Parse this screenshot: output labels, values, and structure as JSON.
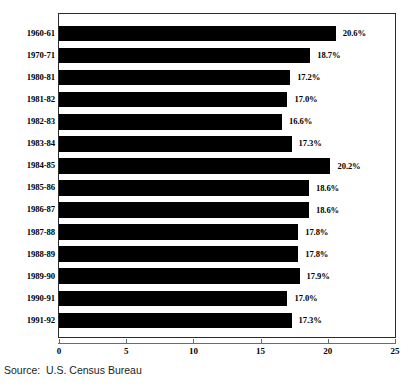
{
  "chart_data": {
    "type": "bar",
    "orientation": "horizontal",
    "title": "",
    "subtitle": "",
    "xlabel": "",
    "ylabel": "",
    "xlim": [
      0,
      25
    ],
    "xticks": [
      "0",
      "5",
      "10",
      "15",
      "20",
      "25"
    ],
    "xtick_values": [
      0,
      5,
      10,
      15,
      20,
      25
    ],
    "grid": false,
    "legend": null,
    "bar_color": "#000000",
    "categories": [
      "1960-61",
      "1970-71",
      "1980-81",
      "1981-82",
      "1982-83",
      "1983-84",
      "1984-85",
      "1985-86",
      "1986-87",
      "1987-88",
      "1988-89",
      "1989-90",
      "1990-91",
      "1991-92"
    ],
    "values": [
      20.6,
      18.7,
      17.2,
      17.0,
      16.6,
      17.3,
      20.2,
      18.6,
      18.6,
      17.8,
      17.8,
      17.9,
      17.0,
      17.3
    ],
    "value_labels": [
      "20.6%",
      "18.7%",
      "17.2%",
      "17.0%",
      "16.6%",
      "17.3%",
      "20.2%",
      "18.6%",
      "18.6%",
      "17.8%",
      "17.8%",
      "17.9%",
      "17.0%",
      "17.3%"
    ]
  },
  "source": {
    "text": "Source:  U.S. Census Bureau"
  }
}
